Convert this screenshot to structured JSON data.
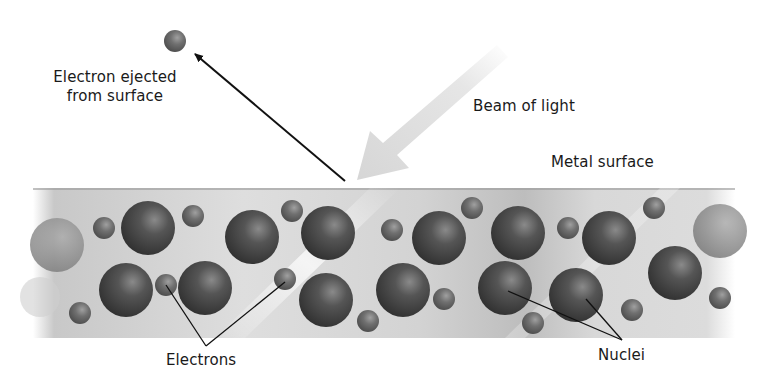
{
  "diagram": {
    "labels": {
      "ejected_line1": "Electron ejected",
      "ejected_line2": "from surface",
      "beam": "Beam of light",
      "metal": "Metal surface",
      "electrons": "Electrons",
      "nuclei": "Nuclei"
    },
    "colors": {
      "band_light": "#e6e6e6",
      "band_dark": "#b5b5b5",
      "sphere_dark": "#3a3a3a",
      "sphere_mid": "#6a6a6a",
      "beam": "#d9d9d9",
      "line": "#111111"
    },
    "band": {
      "x": 33,
      "y": 188,
      "width": 702,
      "height": 150
    },
    "ejected_electron": {
      "cx": 175,
      "cy": 41,
      "r": 11
    },
    "nuclei": [
      {
        "cx": 57,
        "cy": 245,
        "r": 27,
        "faded": true
      },
      {
        "cx": 148,
        "cy": 228,
        "r": 27
      },
      {
        "cx": 126,
        "cy": 290,
        "r": 27
      },
      {
        "cx": 252,
        "cy": 237,
        "r": 27
      },
      {
        "cx": 205,
        "cy": 288,
        "r": 27
      },
      {
        "cx": 328,
        "cy": 233,
        "r": 27
      },
      {
        "cx": 326,
        "cy": 300,
        "r": 27
      },
      {
        "cx": 439,
        "cy": 238,
        "r": 27
      },
      {
        "cx": 403,
        "cy": 290,
        "r": 27
      },
      {
        "cx": 518,
        "cy": 233,
        "r": 27
      },
      {
        "cx": 505,
        "cy": 288,
        "r": 27
      },
      {
        "cx": 609,
        "cy": 238,
        "r": 27
      },
      {
        "cx": 576,
        "cy": 295,
        "r": 27
      },
      {
        "cx": 675,
        "cy": 273,
        "r": 27
      },
      {
        "cx": 720,
        "cy": 231,
        "r": 27,
        "faded": true
      }
    ],
    "electrons": [
      {
        "cx": 104,
        "cy": 228,
        "r": 11
      },
      {
        "cx": 193,
        "cy": 216,
        "r": 11
      },
      {
        "cx": 166,
        "cy": 285,
        "r": 11
      },
      {
        "cx": 80,
        "cy": 313,
        "r": 11
      },
      {
        "cx": 292,
        "cy": 211,
        "r": 11
      },
      {
        "cx": 285,
        "cy": 279,
        "r": 11
      },
      {
        "cx": 392,
        "cy": 230,
        "r": 11
      },
      {
        "cx": 368,
        "cy": 321,
        "r": 11
      },
      {
        "cx": 444,
        "cy": 299,
        "r": 11
      },
      {
        "cx": 472,
        "cy": 208,
        "r": 11
      },
      {
        "cx": 568,
        "cy": 228,
        "r": 11
      },
      {
        "cx": 654,
        "cy": 208,
        "r": 11
      },
      {
        "cx": 533,
        "cy": 323,
        "r": 11
      },
      {
        "cx": 632,
        "cy": 310,
        "r": 11
      },
      {
        "cx": 720,
        "cy": 298,
        "r": 11
      }
    ]
  }
}
